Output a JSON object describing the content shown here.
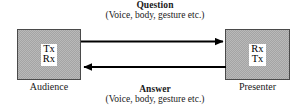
{
  "diagram": {
    "type": "communication-flow",
    "nodes": [
      {
        "id": "audience",
        "label": "Audience",
        "lines": [
          "Tx",
          "Rx"
        ],
        "fill": "#b9b9b9",
        "border": "#4a4a4a"
      },
      {
        "id": "presenter",
        "label": "Presenter",
        "lines": [
          "Rx",
          "Tx"
        ],
        "fill": "#b9b9b9",
        "border": "#4a4a4a"
      }
    ],
    "edges": [
      {
        "id": "question",
        "title": "Question",
        "subtitle": "(Voice, body, gesture etc.)",
        "direction": "left-to-right",
        "from": "audience",
        "to": "presenter",
        "color": "#000000"
      },
      {
        "id": "answer",
        "title": "Answer",
        "subtitle": "(Voice, body, gesture etc.)",
        "direction": "right-to-left",
        "from": "presenter",
        "to": "audience",
        "color": "#000000"
      }
    ]
  }
}
